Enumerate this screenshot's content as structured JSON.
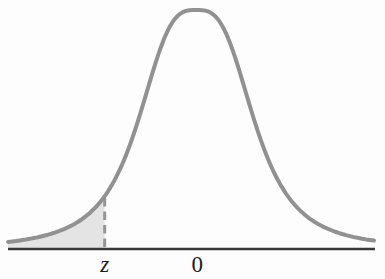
{
  "figure": {
    "kind": "normal distribution curve with shaded left tail",
    "background": "#fdfdfd"
  },
  "labels": {
    "z": "z",
    "zero": "0"
  },
  "colors": {
    "curve": "#919191",
    "shaded_area": "#e4e4e4",
    "axis": "#3a3a3a",
    "dashed_line": "#959595",
    "text": "#1b1b1b"
  },
  "chart_data": {
    "type": "area",
    "title": "",
    "curve": "standard normal probability density",
    "x_range_sigma": [
      -3.6,
      3.4
    ],
    "mean_position_sigma": 0,
    "z_position_sigma": -1.75,
    "shaded_region": {
      "from_sigma": -3.6,
      "to_sigma": -1.75,
      "description": "area under curve to the left of z"
    },
    "x_tick_labels": [
      "z",
      "0"
    ],
    "y_axis_shown": false,
    "grid": false,
    "legend": false
  }
}
